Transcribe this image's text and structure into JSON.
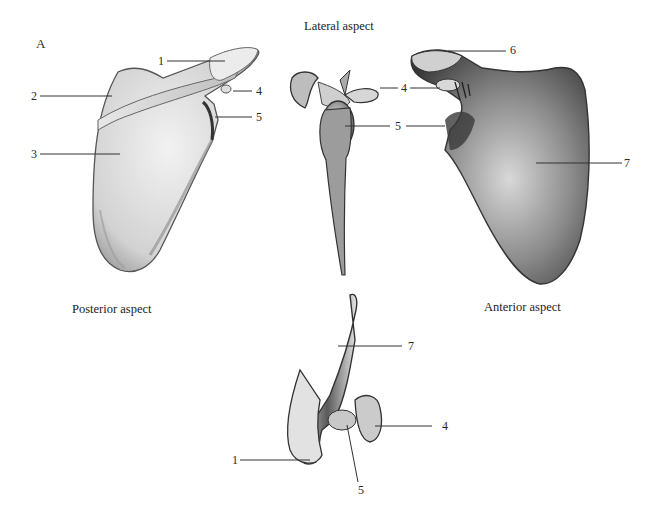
{
  "figure": {
    "letter": "A",
    "views": {
      "lateral": "Lateral aspect",
      "posterior": "Posterior aspect",
      "anterior": "Anterior aspect"
    },
    "labels": {
      "posterior": [
        "1",
        "2",
        "3",
        "4",
        "5"
      ],
      "lateral": [
        "4",
        "5"
      ],
      "anterior": [
        "6",
        "4",
        "5",
        "7"
      ],
      "superior": [
        "7",
        "4",
        "1",
        "5"
      ]
    },
    "colors": {
      "background": "#ffffff",
      "ink": "#2a2a2a",
      "bone_light": "#e6e6e6",
      "bone_mid": "#b5b5b5",
      "bone_dark": "#4a4a4a"
    }
  }
}
